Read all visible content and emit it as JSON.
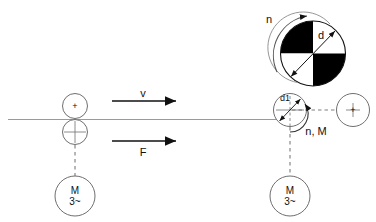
{
  "diagram": {
    "colors": {
      "stroke": "#111111",
      "fill_black": "#000000",
      "fill_white": "#ffffff",
      "baseline": "#9a9a9a",
      "thin_line": "#6f6f6f",
      "dashed": "#6f6f6f"
    },
    "baseline": {
      "name": "workpiece-surface-line"
    },
    "labels": {
      "velocity": "v",
      "force": "F",
      "wheel_diameter": "d",
      "roller_diameter": "d1",
      "wheel_speed": "n",
      "roller_speed_torque": "n, M",
      "motor_symbol": "M",
      "motor_phase": "3~",
      "center_mark": "+"
    },
    "left_station": {
      "name": "left-drive-station",
      "upper_roller_mark": "+",
      "lower_roller_mark": "+",
      "motor_line1": "M",
      "motor_line2": "3~"
    },
    "right_station": {
      "name": "right-drive-station",
      "roller_label": "d1",
      "wheel_label": "d",
      "rotation_label": "n",
      "torque_label": "n, M",
      "idler_mark": "+",
      "motor_line1": "M",
      "motor_line2": "3~"
    },
    "arrows": {
      "velocity_label": "v",
      "force_label": "F"
    }
  }
}
